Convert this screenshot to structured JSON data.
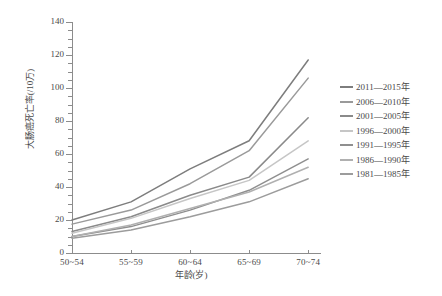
{
  "chart_data": {
    "type": "line",
    "title": "",
    "xlabel": "年龄(岁)",
    "ylabel": "大肠癌死亡率(/10万)",
    "categories": [
      "50~54",
      "55~59",
      "60~64",
      "65~69",
      "70~74"
    ],
    "ylim": [
      0,
      140
    ],
    "yticks": [
      0,
      20,
      40,
      60,
      80,
      100,
      120,
      140
    ],
    "ytick_labels": [
      "0",
      "20",
      "40",
      "60",
      "80",
      "100",
      "120",
      "140"
    ],
    "minor_tick_step": 5,
    "grid": false,
    "legend_position": "right",
    "series": [
      {
        "name": "2011—2015年",
        "color": "#7d7d7d",
        "values": [
          20.0,
          31.0,
          51.0,
          68.0,
          117.0
        ]
      },
      {
        "name": "2006—2010年",
        "color": "#9a9a9a",
        "values": [
          17.5,
          26.0,
          42.0,
          62.0,
          106.0
        ]
      },
      {
        "name": "2001—2005年",
        "color": "#8a8a8a",
        "values": [
          13.0,
          22.0,
          35.0,
          46.0,
          82.0
        ]
      },
      {
        "name": "1996—2000年",
        "color": "#c6c6c6",
        "values": [
          12.0,
          21.0,
          33.0,
          44.0,
          68.0
        ]
      },
      {
        "name": "1991—1995年",
        "color": "#8f8f8f",
        "values": [
          10.0,
          16.0,
          26.0,
          38.0,
          57.0
        ]
      },
      {
        "name": "1986—1990年",
        "color": "#b0b0b0",
        "values": [
          10.0,
          17.0,
          27.0,
          37.0,
          52.0
        ]
      },
      {
        "name": "1981—1985年",
        "color": "#9c9c9c",
        "values": [
          9.0,
          14.0,
          22.0,
          31.0,
          45.0
        ]
      }
    ]
  },
  "legend": {
    "items": [
      {
        "label": "2011—2015年"
      },
      {
        "label": "2006—2010年"
      },
      {
        "label": "2001—2005年"
      },
      {
        "label": "1996—2000年"
      },
      {
        "label": "1991—1995年"
      },
      {
        "label": "1986—1990年"
      },
      {
        "label": "1981—1985年"
      }
    ]
  }
}
